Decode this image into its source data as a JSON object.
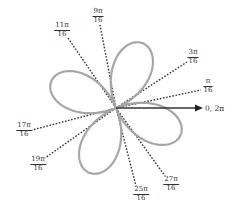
{
  "diagram": {
    "type": "polar-rose",
    "petals": 4,
    "petal_color": "#a6a6a6",
    "ray_color": "#333333",
    "axis_color": "#333333",
    "center": [
      116,
      108
    ],
    "petal_length": 70,
    "petal_center_angles_deg": [
      67.5,
      157.5,
      247.5,
      337.5
    ],
    "axis_label": "0, 2π",
    "rays": [
      {
        "num": "π",
        "den": "16",
        "angle_frac": "π/16"
      },
      {
        "num": "3π",
        "den": "16",
        "angle_frac": "3π/16"
      },
      {
        "num": "9π",
        "den": "16",
        "angle_frac": "9π/16"
      },
      {
        "num": "11π",
        "den": "16",
        "angle_frac": "11π/16"
      },
      {
        "num": "17π",
        "den": "16",
        "angle_frac": "17π/16"
      },
      {
        "num": "19π",
        "den": "16",
        "angle_frac": "19π/16"
      },
      {
        "num": "25π",
        "den": "16",
        "angle_frac": "25π/16"
      },
      {
        "num": "27π",
        "den": "16",
        "angle_frac": "27π/16"
      }
    ]
  }
}
